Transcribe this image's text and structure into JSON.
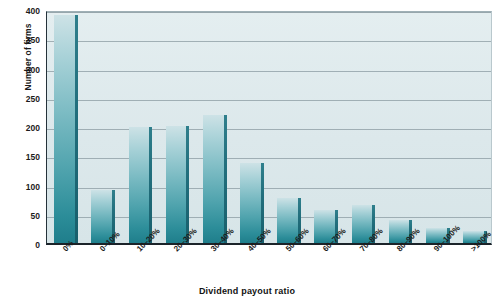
{
  "chart_data": {
    "type": "bar",
    "title": "",
    "xlabel": "Dividend payout ratio",
    "ylabel": "Number of firms",
    "categories": [
      "0%",
      "0–10%",
      "10–20%",
      "20–30%",
      "30–40%",
      "40–50%",
      "50–60%",
      "60–70%",
      "70–80%",
      "80–90%",
      "90–100%",
      ">100%"
    ],
    "values": [
      390,
      90,
      199,
      200,
      219,
      137,
      77,
      57,
      65,
      39,
      25,
      20
    ],
    "ylim": [
      0,
      400
    ],
    "yticks": [
      0,
      50,
      100,
      150,
      200,
      250,
      300,
      350,
      400
    ],
    "ytick_labels": [
      "0",
      "50",
      "100",
      "150",
      "200",
      "250",
      "300",
      "350",
      "400"
    ],
    "grid": true,
    "legend": "none",
    "series_color": "#3f9aa6",
    "bar_edge_color": "#1f7e8b",
    "plot_background": "#dce8eb",
    "gridline_color": "#8b9ba2"
  }
}
